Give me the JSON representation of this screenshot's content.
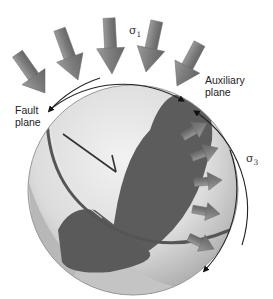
{
  "labels": {
    "sigma1": {
      "symbol": "σ",
      "sub": "1"
    },
    "sigma3": {
      "symbol": "σ",
      "sub": "3"
    },
    "fault_plane_line1": "Fault",
    "fault_plane_line2": "plane",
    "aux_plane_line1": "Auxiliary",
    "aux_plane_line2": "plane"
  },
  "colors": {
    "arrow_fill": "#8a8a8a",
    "arrow_dark": "#6e6e6e",
    "sphere_light": "#e4e4e4",
    "sphere_mid": "#bdbdbd",
    "plane_dark": "#5a5a5a",
    "arc": "#222222"
  }
}
